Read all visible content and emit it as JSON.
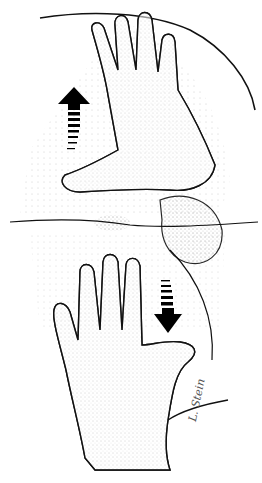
{
  "illustration": {
    "subject": "two hands spreading buttocks apart to expose perianal region",
    "style": "black ink stipple line drawing on white",
    "arrows": [
      {
        "name": "up-arrow",
        "direction": "up",
        "position": "upper-left"
      },
      {
        "name": "down-arrow",
        "direction": "down",
        "position": "lower-right"
      }
    ],
    "signature": "L. Stein"
  }
}
